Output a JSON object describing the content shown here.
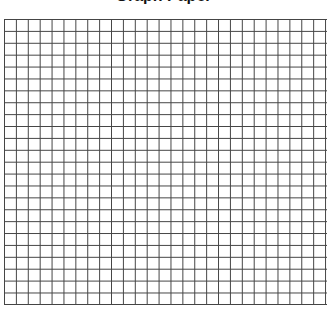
{
  "page": {
    "title": "Graph Paper",
    "title_fragment_right": "•"
  },
  "grid": {
    "columns": 27,
    "rows": 24,
    "cell_size_px": 12,
    "line_color": "#444444",
    "background_color": "#ffffff"
  }
}
